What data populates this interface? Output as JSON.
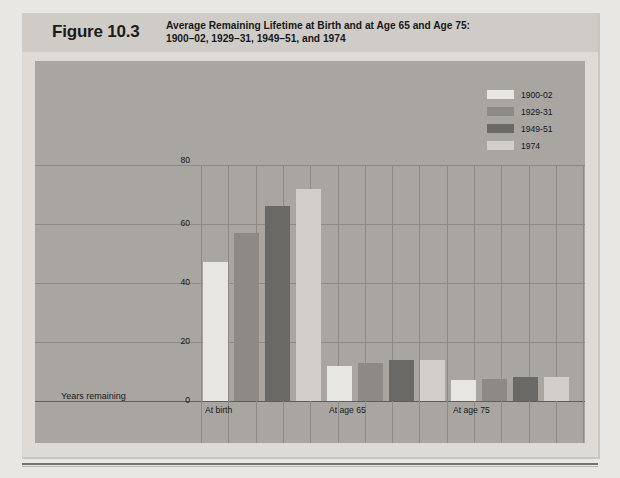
{
  "figure": {
    "number": "Figure 10.3",
    "title_line1": "Average Remaining Lifetime at Birth and at Age 65 and Age 75:",
    "title_line2": "1900–02, 1929–31, 1949–51, and 1974"
  },
  "axis": {
    "y_label": "Years remaining",
    "y_ticks": [
      "0",
      "20",
      "40",
      "60",
      "80"
    ],
    "x_ticks": [
      "At birth",
      "At age 65",
      "At age 75"
    ]
  },
  "legend": {
    "entries": [
      {
        "label": "1900-02",
        "color": "#e8e6e1"
      },
      {
        "label": "1929-31",
        "color": "#8d8a86"
      },
      {
        "label": "1949-51",
        "color": "#6b6966"
      },
      {
        "label": "1974",
        "color": "#d2cfca"
      }
    ]
  },
  "chart_data": {
    "type": "bar",
    "title": "Average Remaining Lifetime at Birth and at Age 65 and Age 75: 1900–02, 1929–31, 1949–51, and 1974",
    "xlabel": "",
    "ylabel": "Years remaining",
    "ylim": [
      0,
      80
    ],
    "yticks": [
      0,
      20,
      40,
      60,
      80
    ],
    "grid": true,
    "legend_position": "top-right",
    "categories": [
      "At birth",
      "At age 65",
      "At age 75"
    ],
    "series": [
      {
        "name": "1900-02",
        "color": "#e8e6e1",
        "values": [
          47,
          12,
          7
        ]
      },
      {
        "name": "1929-31",
        "color": "#8d8a86",
        "values": [
          57,
          13,
          7.5
        ]
      },
      {
        "name": "1949-51",
        "color": "#6b6966",
        "values": [
          66,
          14,
          8
        ]
      },
      {
        "name": "1974",
        "color": "#d2cfca",
        "values": [
          72,
          14,
          8
        ]
      }
    ]
  }
}
